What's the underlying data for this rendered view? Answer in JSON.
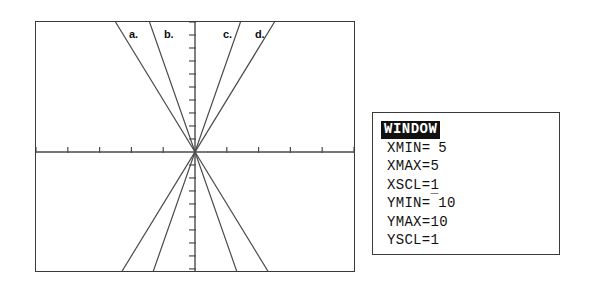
{
  "graph": {
    "frame": {
      "x": 35,
      "y": 21,
      "width": 320,
      "height": 251
    },
    "axes": {
      "x_axis_y": 152,
      "y_axis_x": 195,
      "x_range": [
        -5,
        5
      ],
      "y_range": [
        -10,
        10
      ],
      "x_tick_count": 10,
      "y_tick_count": 20
    },
    "labels": [
      {
        "id": "a",
        "text": "a.",
        "x": 128,
        "y": 28
      },
      {
        "id": "b",
        "text": "b.",
        "x": 163,
        "y": 28
      },
      {
        "id": "c",
        "text": "c.",
        "x": 222,
        "y": 28
      },
      {
        "id": "d",
        "text": "d.",
        "x": 254,
        "y": 28
      }
    ]
  },
  "chart_data": {
    "type": "line",
    "title": "",
    "xlabel": "",
    "ylabel": "",
    "xlim": [
      -5,
      5
    ],
    "ylim": [
      -10,
      10
    ],
    "grid": false,
    "legend": "inline-labels-top",
    "axis_tick_interval": {
      "x": 1,
      "y": 1
    },
    "series": [
      {
        "name": "a.",
        "type": "line",
        "slope": 4,
        "intercept": 0,
        "color": "#4a4a4a",
        "endpoints": [
          [
            -2.5,
            -10
          ],
          [
            2.5,
            10
          ]
        ]
      },
      {
        "name": "b.",
        "type": "line",
        "slope": 7,
        "intercept": 0,
        "color": "#4a4a4a",
        "endpoints": [
          [
            -1.43,
            -10
          ],
          [
            1.43,
            10
          ]
        ]
      },
      {
        "name": "c.",
        "type": "line",
        "slope": -7,
        "intercept": 0,
        "color": "#4a4a4a",
        "endpoints": [
          [
            -1.43,
            10
          ],
          [
            1.43,
            -10
          ]
        ]
      },
      {
        "name": "d.",
        "type": "line",
        "slope": -4,
        "intercept": 0,
        "color": "#4a4a4a",
        "endpoints": [
          [
            -2.5,
            10
          ],
          [
            2.5,
            -10
          ]
        ]
      }
    ]
  },
  "window_panel": {
    "title": "WINDOW",
    "settings": [
      {
        "key": "XMIN=",
        "negative": true,
        "value": "5"
      },
      {
        "key": "XMAX=",
        "negative": false,
        "value": "5"
      },
      {
        "key": "XSCL=",
        "negative": false,
        "value": "1"
      },
      {
        "key": "YMIN=",
        "negative": true,
        "value": "10"
      },
      {
        "key": "YMAX=",
        "negative": false,
        "value": "10"
      },
      {
        "key": "YSCL=",
        "negative": false,
        "value": "1"
      }
    ],
    "negative_glyph": "¯"
  },
  "colors": {
    "border": "#3a3a3a",
    "axis": "#4a4a4a",
    "plot_line": "#4a4a4a",
    "text": "#111111",
    "title_bg": "#111111",
    "title_fg": "#ffffff",
    "background": "#ffffff"
  }
}
